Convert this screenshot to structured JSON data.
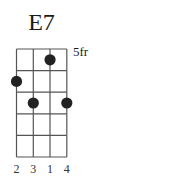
{
  "chord": {
    "name": "E7",
    "start_fret_label": "5fr",
    "strings": 4,
    "frets_shown": 5,
    "dots": [
      {
        "string": 3,
        "fret": 1
      },
      {
        "string": 1,
        "fret": 2
      },
      {
        "string": 2,
        "fret": 3
      },
      {
        "string": 4,
        "fret": 3
      }
    ],
    "fingers": [
      "2",
      "3",
      "1",
      "4"
    ]
  },
  "colors": {
    "line": "#555555",
    "dot": "#222222",
    "text": "#1a1a1a"
  }
}
